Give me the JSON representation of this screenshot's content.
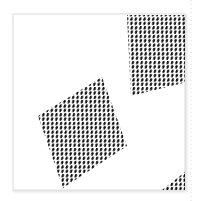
{
  "canvas": {
    "width": 199,
    "height": 201,
    "background_color": "#ffffff",
    "title": "Dotted Parallelogram Pattern"
  },
  "frame": {
    "name": "artboard-frame",
    "x": 13,
    "y": 14,
    "width": 172,
    "height": 176,
    "stroke_color": "#e2e2e2",
    "stroke_width": 1.2,
    "fill_color": "#ffffff",
    "shadow_color": "#f0f0f0"
  },
  "guide_line": {
    "name": "right-dotted-guide",
    "x": 191,
    "y_start": 0,
    "y_end": 201,
    "color": "#dcdcdc",
    "dash": "1 3",
    "stroke_width": 1
  },
  "dot_style": {
    "fill_color": "#111111",
    "radius_x": 1.15,
    "radius_y": 1.95,
    "rotation_deg": -28,
    "lattice_step_x": 4.35,
    "lattice_step_y": 4.35,
    "lattice_shear": 0.46
  },
  "shapes": [
    {
      "name": "lower-left-parallelogram",
      "kind": "parallelogram",
      "vertices": [
        [
          38.0,
          116.0
        ],
        [
          102.0,
          77.0
        ],
        [
          127.0,
          146.0
        ],
        [
          63.0,
          188.0
        ]
      ],
      "fill": "stipple-dots",
      "dot_count_estimate": 196
    },
    {
      "name": "upper-right-parallelogram",
      "kind": "parallelogram-clipped",
      "vertices": [
        [
          127.0,
          15.0
        ],
        [
          199.0,
          15.0
        ],
        [
          199.0,
          79.0
        ],
        [
          131.0,
          96.0
        ]
      ],
      "fill": "stipple-dots",
      "dot_count_estimate": 150
    },
    {
      "name": "bottom-right-corner-cluster",
      "kind": "triangle",
      "vertices": [
        [
          162.0,
          190.0
        ],
        [
          185.0,
          172.0
        ],
        [
          185.0,
          190.0
        ]
      ],
      "fill": "stipple-dots",
      "dot_count_estimate": 14
    }
  ],
  "legend": {
    "visible": false,
    "entries": []
  },
  "labels": {
    "visible": false,
    "items": []
  }
}
